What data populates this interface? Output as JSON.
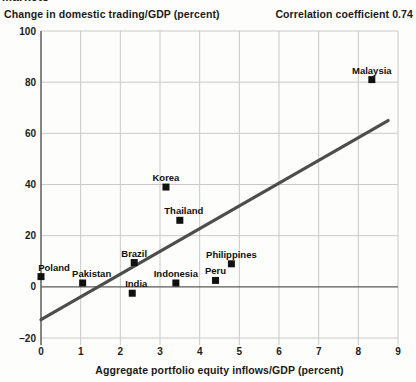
{
  "figure": {
    "kicker_clipped": "Markets"
  },
  "header": {
    "y_axis_title": "Change in domestic trading/GDP (percent)",
    "correlation_note": "Correlation coefficient 0.74"
  },
  "chart_data": {
    "type": "scatter",
    "title": "",
    "xlabel": "Aggregate portfolio equity inflows/GDP (percent)",
    "ylabel": "Change in domestic trading/GDP (percent)",
    "annotation": "Correlation coefficient 0.74",
    "xlim": [
      0,
      9
    ],
    "ylim": [
      -20,
      100
    ],
    "x_ticks": [
      0,
      1,
      2,
      3,
      4,
      5,
      6,
      7,
      8,
      9
    ],
    "y_ticks": [
      -20,
      0,
      20,
      40,
      60,
      80,
      100
    ],
    "y_tick_labels": [
      "–20",
      "0",
      "20",
      "40",
      "60",
      "80",
      "100"
    ],
    "grid": true,
    "legend": "none",
    "points": [
      {
        "label": "Poland",
        "x": 0.0,
        "y": 4,
        "label_dx": 13
      },
      {
        "label": "Pakistan",
        "x": 1.05,
        "y": 1.5,
        "label_dx": 9
      },
      {
        "label": "India",
        "x": 2.3,
        "y": -2.5,
        "label_dx": 4
      },
      {
        "label": "Brazil",
        "x": 2.35,
        "y": 9.5,
        "label_dx": 0
      },
      {
        "label": "Indonesia",
        "x": 3.4,
        "y": 1.5,
        "label_dx": 0
      },
      {
        "label": "Korea",
        "x": 3.15,
        "y": 39,
        "label_dx": 0
      },
      {
        "label": "Thailand",
        "x": 3.5,
        "y": 26,
        "label_dx": 4
      },
      {
        "label": "Peru",
        "x": 4.4,
        "y": 2.5,
        "label_dx": 0
      },
      {
        "label": "Philippines",
        "x": 4.8,
        "y": 9,
        "label_dx": 0
      },
      {
        "label": "Malaysia",
        "x": 8.34,
        "y": 81,
        "label_dx": 0
      }
    ],
    "trend_line": {
      "x1": 0,
      "y1": -12.8,
      "x2": 8.75,
      "y2": 65
    }
  },
  "colors": {
    "background": "#fdfdfb",
    "grid": "#c9c9c9",
    "axis": "#6e6e6e",
    "zero_line": "#5a5a5a",
    "trend": "#4d4d4d",
    "marker": "#111111",
    "text": "#1a1a1a"
  }
}
